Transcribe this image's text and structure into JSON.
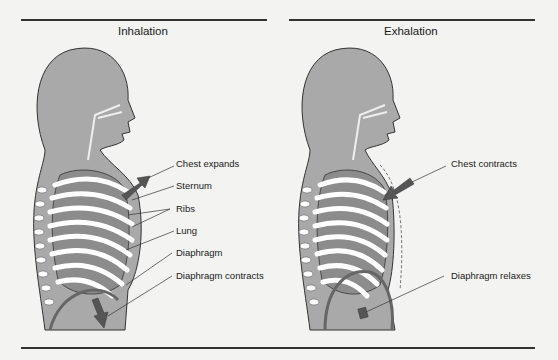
{
  "figure": {
    "panels": [
      {
        "title": "Inhalation",
        "labels": [
          "Chest expands",
          "Sternum",
          "Ribs",
          "Lung",
          "Diaphragm",
          "Diaphragm contracts"
        ]
      },
      {
        "title": "Exhalation",
        "labels": [
          "Chest contracts",
          "Diaphragm relaxes"
        ]
      }
    ]
  },
  "colors": {
    "body": "#a9a9a9",
    "lung": "#8c8c8c",
    "rib": "#ffffff",
    "arrow": "#555555",
    "line": "#333333",
    "background": "#f3f3f1"
  }
}
